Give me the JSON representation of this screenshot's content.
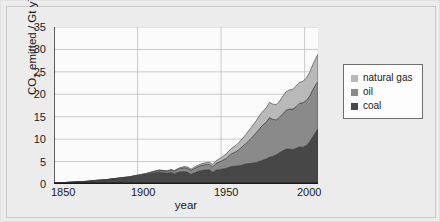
{
  "figure": {
    "background_color": "#ececec",
    "plot_background_color": "#fbfbfb"
  },
  "chart_data": {
    "type": "area",
    "stacked": true,
    "title": "",
    "subtitle": "",
    "xlabel": "year",
    "ylabel_plain": "CO2 emitted / Gt y-1",
    "ylabel_parts": {
      "prefix": "CO",
      "subscript": "2",
      "middle": " emitted / Gt y",
      "superscript": "−1"
    },
    "xlim": [
      1850,
      2008
    ],
    "ylim": [
      0,
      35
    ],
    "xticks": [
      1850,
      1900,
      1950,
      2000
    ],
    "xtick_labels": [
      "1850",
      "1900",
      "1950",
      "2000"
    ],
    "yticks": [
      0,
      5,
      10,
      15,
      20,
      25,
      30,
      35
    ],
    "ytick_labels": [
      "0",
      "5",
      "10",
      "15",
      "20",
      "25",
      "30",
      "35"
    ],
    "grid": true,
    "grid_color": "#b4b4b4",
    "legend_position": "right-outside",
    "legend_entries": [
      {
        "label": "natural gas",
        "color": "#b9b9b9"
      },
      {
        "label": "oil",
        "color": "#8a8a8a"
      },
      {
        "label": "coal",
        "color": "#474747"
      }
    ],
    "x": [
      1850,
      1855,
      1860,
      1865,
      1870,
      1875,
      1880,
      1885,
      1890,
      1895,
      1900,
      1905,
      1910,
      1913,
      1916,
      1918,
      1920,
      1922,
      1925,
      1928,
      1930,
      1932,
      1934,
      1937,
      1940,
      1943,
      1945,
      1947,
      1950,
      1953,
      1956,
      1959,
      1962,
      1965,
      1968,
      1971,
      1974,
      1977,
      1979,
      1981,
      1983,
      1985,
      1987,
      1989,
      1991,
      1993,
      1995,
      1997,
      1999,
      2001,
      2003,
      2005,
      2007,
      2008
    ],
    "series": [
      {
        "name": "coal",
        "color": "#474747",
        "values": [
          0.2,
          0.3,
          0.4,
          0.5,
          0.6,
          0.8,
          0.9,
          1.1,
          1.3,
          1.5,
          1.8,
          2.1,
          2.5,
          2.7,
          2.5,
          2.4,
          2.6,
          2.3,
          2.7,
          2.8,
          2.6,
          2.2,
          2.5,
          2.9,
          3.1,
          3.2,
          2.6,
          3.1,
          3.3,
          3.5,
          3.9,
          4.0,
          4.2,
          4.5,
          4.6,
          4.8,
          5.2,
          5.6,
          6.0,
          6.2,
          6.5,
          7.0,
          7.4,
          7.8,
          7.8,
          7.7,
          8.0,
          8.3,
          8.2,
          8.6,
          9.4,
          10.6,
          11.8,
          12.4
        ]
      },
      {
        "name": "oil",
        "color": "#8a8a8a",
        "values": [
          0.0,
          0.0,
          0.0,
          0.0,
          0.0,
          0.0,
          0.0,
          0.05,
          0.08,
          0.1,
          0.15,
          0.2,
          0.3,
          0.35,
          0.4,
          0.45,
          0.5,
          0.55,
          0.7,
          0.85,
          0.9,
          0.85,
          0.95,
          1.1,
          1.2,
          1.2,
          1.2,
          1.5,
          1.8,
          2.2,
          2.8,
          3.2,
          3.9,
          4.6,
          5.6,
          6.6,
          7.6,
          8.2,
          8.8,
          8.2,
          7.8,
          7.9,
          8.3,
          8.7,
          8.9,
          9.0,
          9.3,
          9.7,
          9.9,
          10.0,
          10.2,
          10.5,
          10.6,
          10.4
        ]
      },
      {
        "name": "natural gas",
        "color": "#b9b9b9",
        "values": [
          0.0,
          0.0,
          0.0,
          0.0,
          0.0,
          0.0,
          0.0,
          0.0,
          0.0,
          0.0,
          0.02,
          0.04,
          0.06,
          0.08,
          0.1,
          0.12,
          0.15,
          0.17,
          0.2,
          0.25,
          0.28,
          0.26,
          0.3,
          0.35,
          0.4,
          0.45,
          0.5,
          0.6,
          0.75,
          0.95,
          1.2,
          1.45,
          1.7,
          2.0,
          2.4,
          2.7,
          3.0,
          3.2,
          3.4,
          3.4,
          3.4,
          3.6,
          3.9,
          4.1,
          4.3,
          4.4,
          4.6,
          4.7,
          4.8,
          5.0,
          5.3,
          5.6,
          5.9,
          6.1
        ]
      }
    ],
    "totals_note": "stacked total peaks near 29 Gt at 2008"
  }
}
